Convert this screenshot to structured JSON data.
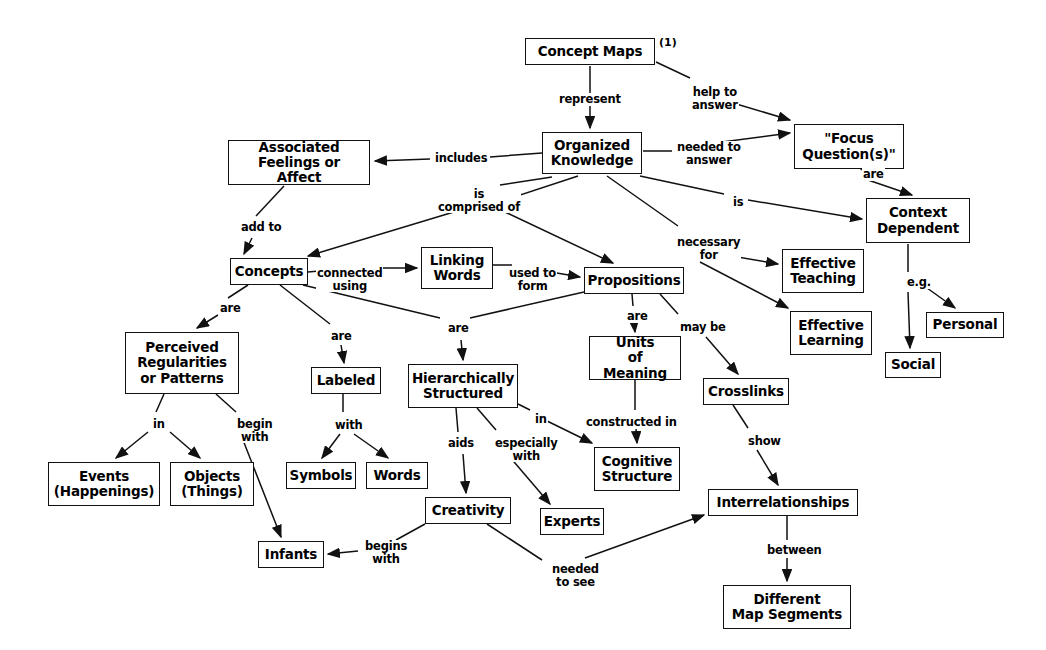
{
  "diagram": {
    "title": "Concept Maps",
    "annotation": "(1)"
  },
  "nodes": [
    {
      "id": "concept-maps",
      "label": "Concept Maps",
      "x": 525,
      "y": 38,
      "w": 130,
      "h": 27
    },
    {
      "id": "organized-knowledge",
      "label": "Organized\nKnowledge",
      "x": 542,
      "y": 132,
      "w": 100,
      "h": 42
    },
    {
      "id": "focus-questions",
      "label": "\"Focus\nQuestion(s)\"",
      "x": 794,
      "y": 124,
      "w": 110,
      "h": 45
    },
    {
      "id": "associated-feelings",
      "label": "Associated\nFeelings or Affect",
      "x": 228,
      "y": 140,
      "w": 142,
      "h": 45
    },
    {
      "id": "context-dependent",
      "label": "Context\nDependent",
      "x": 866,
      "y": 198,
      "w": 104,
      "h": 45
    },
    {
      "id": "concepts",
      "label": "Concepts",
      "x": 230,
      "y": 258,
      "w": 78,
      "h": 27
    },
    {
      "id": "linking-words",
      "label": "Linking\nWords",
      "x": 421,
      "y": 247,
      "w": 72,
      "h": 42
    },
    {
      "id": "propositions",
      "label": "Propositions",
      "x": 584,
      "y": 267,
      "w": 100,
      "h": 27
    },
    {
      "id": "effective-teaching",
      "label": "Effective\nTeaching",
      "x": 782,
      "y": 249,
      "w": 82,
      "h": 44
    },
    {
      "id": "effective-learning",
      "label": "Effective\nLearning",
      "x": 790,
      "y": 311,
      "w": 82,
      "h": 44
    },
    {
      "id": "personal",
      "label": "Personal",
      "x": 926,
      "y": 312,
      "w": 78,
      "h": 26
    },
    {
      "id": "social",
      "label": "Social",
      "x": 885,
      "y": 352,
      "w": 56,
      "h": 26
    },
    {
      "id": "perceived-regularities",
      "label": "Perceived\nRegularities\nor Patterns",
      "x": 125,
      "y": 332,
      "w": 114,
      "h": 62
    },
    {
      "id": "labeled",
      "label": "Labeled",
      "x": 311,
      "y": 367,
      "w": 70,
      "h": 27
    },
    {
      "id": "hierarchically-structured",
      "label": "Hierarchically\nStructured",
      "x": 408,
      "y": 364,
      "w": 110,
      "h": 44
    },
    {
      "id": "units-of-meaning",
      "label": "Units\nof Meaning",
      "x": 589,
      "y": 336,
      "w": 92,
      "h": 44
    },
    {
      "id": "crosslinks",
      "label": "Crosslinks",
      "x": 703,
      "y": 378,
      "w": 86,
      "h": 27
    },
    {
      "id": "cognitive-structure",
      "label": "Cognitive\nStructure",
      "x": 594,
      "y": 447,
      "w": 86,
      "h": 44
    },
    {
      "id": "symbols",
      "label": "Symbols",
      "x": 286,
      "y": 462,
      "w": 70,
      "h": 27
    },
    {
      "id": "words",
      "label": "Words",
      "x": 366,
      "y": 462,
      "w": 62,
      "h": 27
    },
    {
      "id": "events",
      "label": "Events\n(Happenings)",
      "x": 48,
      "y": 462,
      "w": 112,
      "h": 44
    },
    {
      "id": "objects",
      "label": "Objects\n(Things)",
      "x": 170,
      "y": 462,
      "w": 84,
      "h": 44
    },
    {
      "id": "creativity",
      "label": "Creativity",
      "x": 425,
      "y": 497,
      "w": 86,
      "h": 27
    },
    {
      "id": "experts",
      "label": "Experts",
      "x": 540,
      "y": 508,
      "w": 64,
      "h": 27
    },
    {
      "id": "interrelationships",
      "label": "Interrelationships",
      "x": 708,
      "y": 489,
      "w": 150,
      "h": 27
    },
    {
      "id": "infants",
      "label": "Infants",
      "x": 258,
      "y": 541,
      "w": 66,
      "h": 27
    },
    {
      "id": "different-map-segments",
      "label": "Different\nMap Segments",
      "x": 723,
      "y": 585,
      "w": 128,
      "h": 44
    }
  ],
  "link_labels": [
    {
      "id": "represent",
      "text": "represent",
      "x": 558,
      "y": 93
    },
    {
      "id": "help-to-answer",
      "text": "help to\nanswer",
      "x": 691,
      "y": 86
    },
    {
      "id": "needed-to-answer",
      "text": "needed to\nanswer",
      "x": 676,
      "y": 141
    },
    {
      "id": "includes",
      "text": "includes",
      "x": 434,
      "y": 152
    },
    {
      "id": "are-focus",
      "text": "are",
      "x": 862,
      "y": 168
    },
    {
      "id": "is-context",
      "text": "is",
      "x": 732,
      "y": 196
    },
    {
      "id": "is-comprised-of",
      "text": "is\ncomprised of",
      "x": 437,
      "y": 188
    },
    {
      "id": "add-to",
      "text": "add to",
      "x": 240,
      "y": 221
    },
    {
      "id": "connected-using",
      "text": "connected\nusing",
      "x": 316,
      "y": 267
    },
    {
      "id": "used-to-form",
      "text": "used to\nform",
      "x": 508,
      "y": 267
    },
    {
      "id": "necessary-for",
      "text": "necessary\nfor",
      "x": 676,
      "y": 236
    },
    {
      "id": "eg",
      "text": "e.g.",
      "x": 906,
      "y": 276
    },
    {
      "id": "are-concepts",
      "text": "are",
      "x": 219,
      "y": 302
    },
    {
      "id": "are-labeled",
      "text": "are",
      "x": 330,
      "y": 330
    },
    {
      "id": "are-hier",
      "text": "are",
      "x": 447,
      "y": 322
    },
    {
      "id": "are-units",
      "text": "are",
      "x": 626,
      "y": 310
    },
    {
      "id": "may-be",
      "text": "may be",
      "x": 679,
      "y": 321
    },
    {
      "id": "in-events",
      "text": "in",
      "x": 152,
      "y": 418
    },
    {
      "id": "begin-with",
      "text": "begin\nwith",
      "x": 236,
      "y": 418
    },
    {
      "id": "with-symbols",
      "text": "with",
      "x": 334,
      "y": 419
    },
    {
      "id": "aids",
      "text": "aids",
      "x": 447,
      "y": 437
    },
    {
      "id": "especially-with",
      "text": "especially\nwith",
      "x": 494,
      "y": 437
    },
    {
      "id": "in-cognitive",
      "text": "in",
      "x": 534,
      "y": 413
    },
    {
      "id": "constructed-in",
      "text": "constructed in",
      "x": 585,
      "y": 416
    },
    {
      "id": "show",
      "text": "show",
      "x": 747,
      "y": 435
    },
    {
      "id": "begins-with",
      "text": "begins\nwith",
      "x": 364,
      "y": 540
    },
    {
      "id": "needed-to-see",
      "text": "needed\nto see",
      "x": 551,
      "y": 563
    },
    {
      "id": "between",
      "text": "between",
      "x": 766,
      "y": 544
    }
  ],
  "edges": [
    {
      "id": "concept-maps-to-organized",
      "from": "concept-maps",
      "to": "organized-knowledge",
      "arrow": true
    },
    {
      "id": "concept-maps-to-focus",
      "from": "concept-maps",
      "to": "focus-questions",
      "arrow": true
    },
    {
      "id": "organized-to-focus",
      "from": "organized-knowledge",
      "to": "focus-questions",
      "arrow": true
    },
    {
      "id": "organized-to-feelings",
      "from": "organized-knowledge",
      "to": "associated-feelings",
      "arrow": true
    },
    {
      "id": "organized-to-context",
      "from": "organized-knowledge",
      "to": "context-dependent",
      "arrow": true
    },
    {
      "id": "organized-to-concepts",
      "from": "organized-knowledge",
      "to": "concepts",
      "arrow": true
    },
    {
      "id": "organized-to-propositions",
      "from": "organized-knowledge",
      "to": "propositions",
      "arrow": true
    },
    {
      "id": "organized-to-teaching",
      "from": "organized-knowledge",
      "to": "effective-teaching",
      "arrow": true
    },
    {
      "id": "organized-to-learning",
      "from": "organized-knowledge",
      "to": "effective-learning",
      "arrow": true
    },
    {
      "id": "focus-to-context",
      "from": "focus-questions",
      "to": "context-dependent",
      "arrow": true
    },
    {
      "id": "feelings-to-concepts",
      "from": "associated-feelings",
      "to": "concepts",
      "arrow": true
    },
    {
      "id": "context-to-social",
      "from": "context-dependent",
      "to": "social",
      "arrow": true
    },
    {
      "id": "context-to-personal",
      "from": "context-dependent",
      "to": "personal",
      "arrow": true
    },
    {
      "id": "concepts-to-linking",
      "from": "concepts",
      "to": "linking-words",
      "arrow": true
    },
    {
      "id": "linking-to-propositions",
      "from": "linking-words",
      "to": "propositions",
      "arrow": true
    },
    {
      "id": "concepts-to-perceived",
      "from": "concepts",
      "to": "perceived-regularities",
      "arrow": true
    },
    {
      "id": "concepts-to-labeled",
      "from": "concepts",
      "to": "labeled",
      "arrow": true
    },
    {
      "id": "concepts-to-hierarchical",
      "from": "concepts",
      "to": "hierarchically-structured",
      "arrow": true
    },
    {
      "id": "propositions-to-hierarchical",
      "from": "propositions",
      "to": "hierarchically-structured",
      "arrow": true
    },
    {
      "id": "propositions-to-units",
      "from": "propositions",
      "to": "units-of-meaning",
      "arrow": true
    },
    {
      "id": "propositions-to-crosslinks",
      "from": "propositions",
      "to": "crosslinks",
      "arrow": true
    },
    {
      "id": "perceived-to-events",
      "from": "perceived-regularities",
      "to": "events",
      "arrow": true
    },
    {
      "id": "perceived-to-objects",
      "from": "perceived-regularities",
      "to": "objects",
      "arrow": true
    },
    {
      "id": "perceived-to-infants",
      "from": "perceived-regularities",
      "to": "infants",
      "arrow": true
    },
    {
      "id": "labeled-to-symbols",
      "from": "labeled",
      "to": "symbols",
      "arrow": true
    },
    {
      "id": "labeled-to-words",
      "from": "labeled",
      "to": "words",
      "arrow": true
    },
    {
      "id": "hierarchical-to-creativity",
      "from": "hierarchically-structured",
      "to": "creativity",
      "arrow": true
    },
    {
      "id": "hierarchical-to-experts",
      "from": "hierarchically-structured",
      "to": "experts",
      "arrow": true
    },
    {
      "id": "hierarchical-to-cognitive",
      "from": "hierarchically-structured",
      "to": "cognitive-structure",
      "arrow": true
    },
    {
      "id": "units-to-cognitive",
      "from": "units-of-meaning",
      "to": "cognitive-structure",
      "arrow": true
    },
    {
      "id": "crosslinks-to-interrel",
      "from": "crosslinks",
      "to": "interrelationships",
      "arrow": true
    },
    {
      "id": "creativity-to-infants",
      "from": "creativity",
      "to": "infants",
      "arrow": true
    },
    {
      "id": "creativity-to-interrel",
      "from": "creativity",
      "to": "interrelationships",
      "arrow": true
    },
    {
      "id": "interrel-to-segments",
      "from": "interrelationships",
      "to": "different-map-segments",
      "arrow": true
    }
  ],
  "colors": {
    "line": "#111111",
    "box_border": "#111111",
    "text": "#000000",
    "background": "#ffffff"
  }
}
